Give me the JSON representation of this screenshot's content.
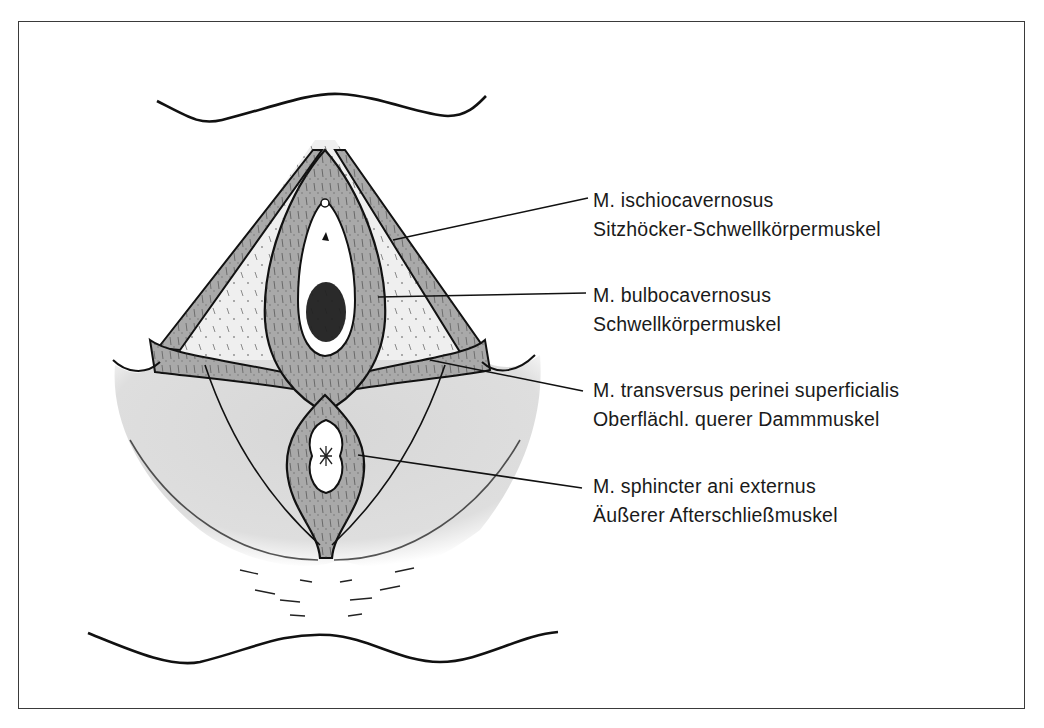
{
  "figure": {
    "colors": {
      "muscle_fill": "#a9a9a9",
      "skin_fill": "#dcdcdc",
      "triangle_fill": "#ebebeb",
      "outline": "#111111",
      "frame": "#3a3a3a"
    }
  },
  "labels": [
    {
      "latin": "M. ischiocavernosus",
      "german": "Sitzhöcker-Schwellkörpermuskel",
      "top": 186
    },
    {
      "latin": "M. bulbocavernosus",
      "german": "Schwellkörpermuskel",
      "top": 281
    },
    {
      "latin": "M. transversus perinei superficialis",
      "german": "Oberflächl. querer Dammmuskel",
      "top": 376
    },
    {
      "latin": "M. sphincter ani externus",
      "german": "Äußerer Afterschließmuskel",
      "top": 472
    }
  ]
}
